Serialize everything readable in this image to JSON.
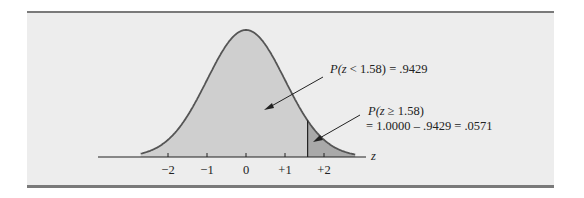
{
  "chart_data": {
    "type": "area",
    "title": "",
    "xlabel": "z",
    "ylabel": "",
    "x_ticks": [
      "−2",
      "−1",
      "0",
      "+1",
      "+2"
    ],
    "x_tick_values": [
      -2,
      -1,
      0,
      1,
      2
    ],
    "xlim": [
      -2.7,
      2.8
    ],
    "grid": false,
    "legend": "none",
    "cutoff_z": 1.58,
    "series": [
      {
        "name": "P(z < 1.58)",
        "region": [
          -2.7,
          1.58
        ],
        "value": 0.9429,
        "fill": "#cfcfcf"
      },
      {
        "name": "P(z ≥ 1.58)",
        "region": [
          1.58,
          2.8
        ],
        "value": 0.0571,
        "fill": "#a9a9a9"
      }
    ],
    "annotations": [
      {
        "text_prefix": "P(",
        "text_var": "z",
        "text_rest": " < 1.58)  = .9429"
      },
      {
        "line1_prefix": "P(",
        "line1_var": "z",
        "line1_rest": " ≥ 1.58)",
        "line2": "= 1.0000 – .9429 = .0571"
      }
    ]
  },
  "colors": {
    "panel_bg": "#ededed",
    "panel_rule": "#7a7a7a",
    "curve": "#555555",
    "left_fill": "#cfcfcf",
    "tail_fill": "#a9a9a9",
    "axis": "#222222"
  }
}
